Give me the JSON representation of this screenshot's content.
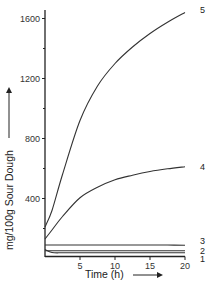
{
  "chart_data": {
    "type": "line",
    "title": "",
    "xlabel": "Time (h)",
    "ylabel": "mg/100g Sour Dough",
    "xlim": [
      0,
      20
    ],
    "ylim": [
      0,
      1700
    ],
    "x_ticks": [
      5,
      10,
      15,
      20
    ],
    "x_tick_labels": [
      "5",
      "10",
      "15",
      "20"
    ],
    "y_ticks": [
      400,
      800,
      1200,
      1600
    ],
    "y_tick_labels": [
      "400",
      "800",
      "1200",
      "1600"
    ],
    "y_minor_ticks": [
      200,
      600,
      1000,
      1400
    ],
    "grid": false,
    "legend": "inline labels at right end of each curve",
    "x": [
      0,
      1,
      2.5,
      5,
      7.5,
      10,
      12.5,
      15,
      17.5,
      20
    ],
    "series": [
      {
        "name": "1",
        "values": [
          60,
          40,
          38,
          38,
          38,
          38,
          38,
          38,
          38,
          38
        ]
      },
      {
        "name": "2",
        "values": [
          52,
          52,
          52,
          52,
          52,
          52,
          52,
          52,
          52,
          52
        ]
      },
      {
        "name": "3",
        "values": [
          90,
          90,
          90,
          90,
          90,
          90,
          90,
          90,
          90,
          88
        ]
      },
      {
        "name": "4",
        "values": [
          130,
          190,
          280,
          405,
          475,
          525,
          555,
          580,
          598,
          612
        ]
      },
      {
        "name": "5",
        "values": [
          210,
          320,
          560,
          920,
          1150,
          1300,
          1410,
          1500,
          1575,
          1640
        ]
      }
    ]
  },
  "axes": {
    "x_title": "Time (h)",
    "y_title": "mg/100g Sour Dough"
  }
}
